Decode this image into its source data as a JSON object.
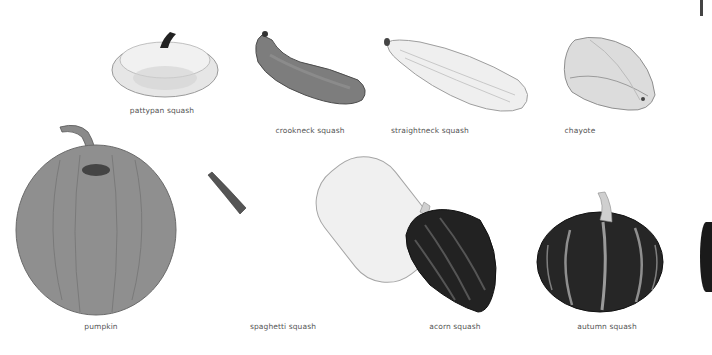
{
  "figure": {
    "background": "#ffffff",
    "label_color": "#555555",
    "items": [
      {
        "id": "pattypan",
        "label": "pattypan squash",
        "row": 1,
        "shade": "#e9e9e9"
      },
      {
        "id": "crookneck",
        "label": "crookneck squash",
        "row": 1,
        "shade": "#7d7d7d"
      },
      {
        "id": "straightneck",
        "label": "straightneck squash",
        "row": 1,
        "shade": "#ececec"
      },
      {
        "id": "chayote",
        "label": "chayote",
        "row": 1,
        "shade": "#d8d8d8"
      },
      {
        "id": "pumpkin",
        "label": "pumpkin",
        "row": 2,
        "shade": "#8f8f8f"
      },
      {
        "id": "spaghetti",
        "label": "spaghetti squash",
        "row": 2,
        "shade": "#eeeeee"
      },
      {
        "id": "acorn",
        "label": "acorn squash",
        "row": 2,
        "shade": "#222222"
      },
      {
        "id": "autumn",
        "label": "autumn squash",
        "row": 2,
        "shade": "#262626"
      }
    ]
  }
}
